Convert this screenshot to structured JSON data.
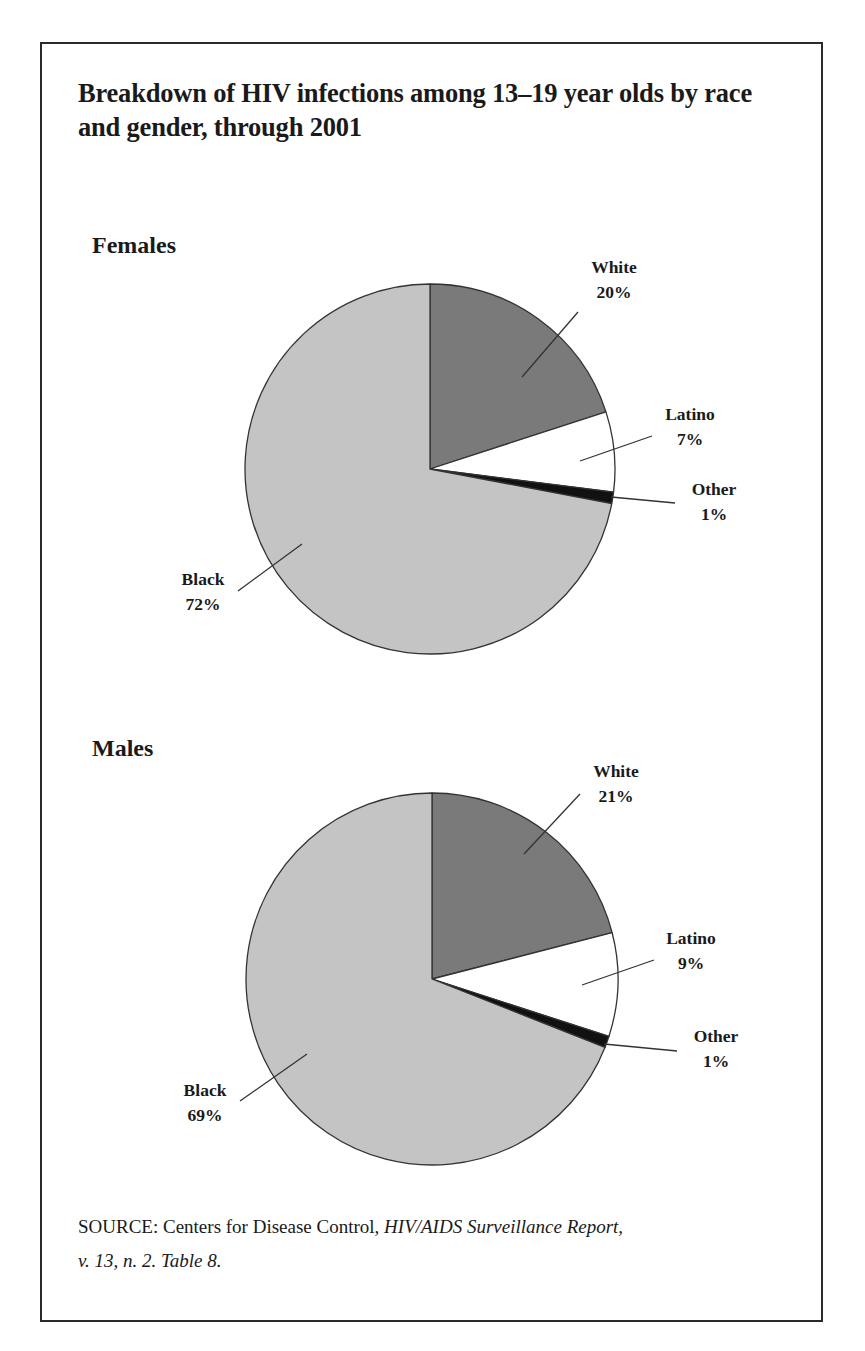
{
  "title": "Breakdown of HIV infections among 13–19 year olds by race and gender, through 2001",
  "colors": {
    "white_slice": "#7a7a7a",
    "latino_slice": "#ffffff",
    "other_slice": "#111111",
    "black_slice": "#c4c4c4",
    "outline": "#333333"
  },
  "females": {
    "label": "Females",
    "slices": [
      {
        "name": "White",
        "pct_label": "20%"
      },
      {
        "name": "Latino",
        "pct_label": "7%"
      },
      {
        "name": "Other",
        "pct_label": "1%"
      },
      {
        "name": "Black",
        "pct_label": "72%"
      }
    ]
  },
  "males": {
    "label": "Males",
    "slices": [
      {
        "name": "White",
        "pct_label": "21%"
      },
      {
        "name": "Latino",
        "pct_label": "9%"
      },
      {
        "name": "Other",
        "pct_label": "1%"
      },
      {
        "name": "Black",
        "pct_label": "69%"
      }
    ]
  },
  "source": {
    "prefix": "SOURCE: Centers for Disease Control, ",
    "publication": "HIV/AIDS Surveillance Report,",
    "details": "v. 13, n. 2. Table 8."
  },
  "chart_data": [
    {
      "type": "pie",
      "title": "Females",
      "categories": [
        "White",
        "Latino",
        "Other",
        "Black"
      ],
      "values": [
        20,
        7,
        1,
        72
      ],
      "unit": "%",
      "start_angle": "12 o'clock, clockwise",
      "legend": "none (direct labels with leader lines)"
    },
    {
      "type": "pie",
      "title": "Males",
      "categories": [
        "White",
        "Latino",
        "Other",
        "Black"
      ],
      "values": [
        21,
        9,
        1,
        69
      ],
      "unit": "%",
      "start_angle": "12 o'clock, clockwise",
      "legend": "none (direct labels with leader lines)"
    }
  ]
}
